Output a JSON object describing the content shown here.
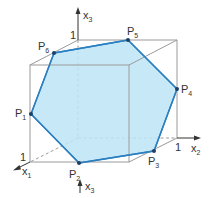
{
  "diagram": {
    "type": "3d-cube-cross-section",
    "colors": {
      "cube_edge": "#9a9a9a",
      "hexagon_fill": "#bde5f6",
      "hexagon_edge": "#2b7fc1",
      "point": "#1c3f66",
      "text": "#333333"
    },
    "axes": {
      "x1": {
        "label": "x",
        "sub": "1",
        "unit_tick": "1"
      },
      "x2": {
        "label": "x",
        "sub": "2",
        "unit_tick": "1"
      },
      "x3": {
        "label": "x",
        "sub": "3",
        "unit_tick": "1"
      },
      "x3_bottom": {
        "label": "x",
        "sub": "3"
      }
    },
    "points": [
      {
        "name": "P",
        "sub": "1"
      },
      {
        "name": "P",
        "sub": "2"
      },
      {
        "name": "P",
        "sub": "3"
      },
      {
        "name": "P",
        "sub": "4"
      },
      {
        "name": "P",
        "sub": "5"
      },
      {
        "name": "P",
        "sub": "6"
      }
    ]
  }
}
